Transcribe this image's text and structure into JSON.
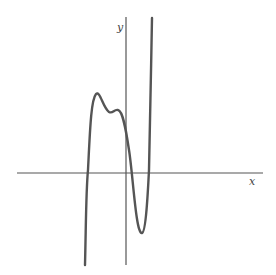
{
  "chart_data": {
    "type": "line",
    "title": "",
    "xlabel": "x",
    "ylabel": "y",
    "grid": false,
    "legend": null,
    "axes": {
      "x_axis": {
        "x1": 17,
        "y1": 173,
        "x2": 263,
        "y2": 173
      },
      "y_axis": {
        "x1": 126,
        "y1": 17,
        "x2": 126,
        "y2": 265
      }
    },
    "labels": {
      "x": {
        "text": "x",
        "px": 249,
        "py": 185
      },
      "y": {
        "text": "y",
        "px": 117,
        "py": 31
      }
    },
    "curve_path": "M 85 265 C 86 225, 86 190, 88 170 C 90 130, 91 100, 96 94 C 100 90, 103 108, 109 112 C 113 114, 114 109, 118 110 C 123 111, 126 130, 129 150 C 133 175, 136 235, 142 233 C 146 232, 148 190, 149 170 C 150 130, 151 70, 152 18",
    "key_points": [
      {
        "label": "x-intercept-1",
        "px": 87,
        "py": 173
      },
      {
        "label": "local-max-1",
        "px": 96,
        "py": 94
      },
      {
        "label": "local-min-1",
        "px": 109,
        "py": 113
      },
      {
        "label": "local-max-2",
        "px": 117,
        "py": 110
      },
      {
        "label": "y-intercept",
        "px": 126,
        "py": 138
      },
      {
        "label": "x-intercept-2",
        "px": 132,
        "py": 173
      },
      {
        "label": "local-min-2",
        "px": 142,
        "py": 233
      },
      {
        "label": "x-intercept-3",
        "px": 148,
        "py": 173
      }
    ],
    "colors": {
      "axis": "#555555",
      "curve": "#555555",
      "background": "#ffffff"
    }
  }
}
